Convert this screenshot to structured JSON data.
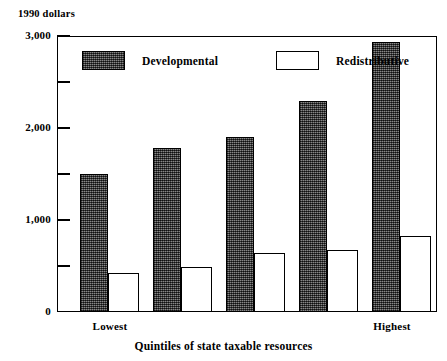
{
  "chart_data": {
    "type": "bar",
    "title": "",
    "subtitle": "",
    "xlabel": "Quintiles of state taxable resources",
    "ylabel": "1990 dollars",
    "unit_caption": "1990 dollars",
    "categories": [
      "Lowest",
      "2",
      "3",
      "4",
      "Highest"
    ],
    "visible_tick_labels": [
      "Lowest",
      "Highest"
    ],
    "series": [
      {
        "name": "Developmental",
        "values": [
          1500,
          1780,
          1900,
          2290,
          2935
        ],
        "fill": "dark-hatch",
        "color": "#4d4d4d"
      },
      {
        "name": "Redistributive",
        "values": [
          425,
          490,
          640,
          675,
          830
        ],
        "fill": "white",
        "color": "#ffffff"
      }
    ],
    "ylim": [
      0,
      3000
    ],
    "y_major_ticks": [
      0,
      1000,
      2000,
      3000
    ],
    "y_major_tick_labels": [
      "0",
      "1,000",
      "2,000",
      "3,000"
    ],
    "y_minor_ticks": [
      500,
      1500,
      2500
    ],
    "grid": false,
    "legend_position": "inside-top-left"
  },
  "legend": {
    "entries": [
      {
        "label": "Developmental"
      },
      {
        "label": "Redistributive"
      }
    ]
  },
  "axis": {
    "y_unit": "1990 dollars",
    "x_title": "Quintiles of state taxable resources",
    "y_labels": {
      "t0": "0",
      "t1000": "1,000",
      "t2000": "2,000",
      "t3000": "3,000"
    },
    "x_labels": {
      "first": "Lowest",
      "last": "Highest"
    }
  },
  "colors": {
    "axis": "#000000",
    "developmental": "#4d4d4d",
    "redistributive": "#ffffff",
    "background": "#ffffff"
  }
}
